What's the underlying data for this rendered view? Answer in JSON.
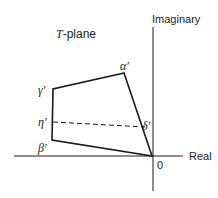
{
  "diagram": {
    "title": "T-plane",
    "title_italic_part": "T",
    "title_rest": "-plane",
    "axes": {
      "x_label": "Real",
      "y_label": "Imaginary",
      "origin_label": "0"
    },
    "vertices": [
      {
        "name": "alpha",
        "label": "α′",
        "x": 124,
        "y": 73
      },
      {
        "name": "gamma",
        "label": "γ′",
        "x": 53,
        "y": 89
      },
      {
        "name": "eta",
        "label": "η′",
        "x": 53,
        "y": 122
      },
      {
        "name": "beta",
        "label": "β′",
        "x": 52,
        "y": 140
      },
      {
        "name": "delta",
        "label": "δ′",
        "x": 145,
        "y": 127
      },
      {
        "name": "origin",
        "label": "0",
        "x": 152,
        "y": 156
      }
    ],
    "polygon_order": [
      "alpha",
      "gamma",
      "beta",
      "origin"
    ],
    "dashed_segment": [
      "eta",
      "delta"
    ],
    "colors": {
      "line": "#1a1a1a",
      "text": "#222222"
    }
  }
}
